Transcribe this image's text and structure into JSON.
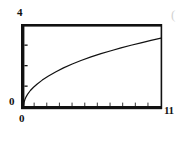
{
  "figure": {
    "kind": "line-plot",
    "background_color": "#ffffff",
    "ink_color": "#111111"
  },
  "labels": {
    "y_max": "4",
    "y_min": "0",
    "x_min": "0",
    "x_max": "11",
    "edge_artifact": "("
  },
  "chart_data": {
    "type": "line",
    "title": "",
    "subtitle": "",
    "xlabel": "",
    "ylabel": "",
    "xlim": [
      0,
      11
    ],
    "ylim": [
      0,
      4
    ],
    "xticklabels": [
      "0",
      "11"
    ],
    "yticklabels": [
      "0",
      "4"
    ],
    "grid": false,
    "legend": null,
    "legend_position": "none",
    "annotations": [],
    "x_major_ticks": [
      0,
      1,
      2,
      3,
      4,
      5,
      6,
      7,
      8,
      9,
      10,
      11
    ],
    "y_major_ticks": [
      0,
      1,
      2,
      3,
      4
    ],
    "series": [
      {
        "name": "curve",
        "color": "#111111",
        "line_width": 1.2,
        "x": [
          0.0,
          0.05,
          0.12,
          0.22,
          0.35,
          0.55,
          0.8,
          1.1,
          1.5,
          2.0,
          2.6,
          3.2,
          3.9,
          4.6,
          5.4,
          6.2,
          7.0,
          7.8,
          8.6,
          9.4,
          10.2,
          11.0
        ],
        "y": [
          0.0,
          0.24,
          0.38,
          0.51,
          0.65,
          0.81,
          0.97,
          1.13,
          1.32,
          1.52,
          1.73,
          1.92,
          2.11,
          2.28,
          2.46,
          2.62,
          2.76,
          2.9,
          3.03,
          3.15,
          3.27,
          3.38
        ]
      }
    ]
  }
}
